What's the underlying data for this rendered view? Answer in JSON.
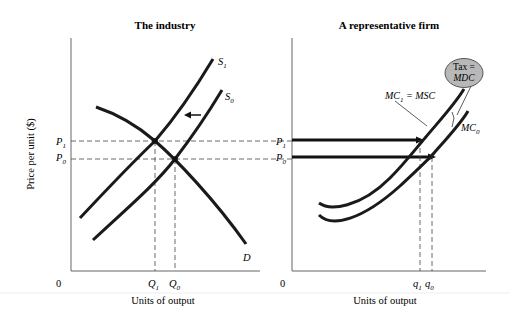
{
  "left_panel": {
    "title": "The industry",
    "y_axis_label": "Price per unit ($)",
    "x_axis_label": "Units of output",
    "origin_label": "0",
    "price_labels": [
      {
        "main": "P",
        "sub": "1"
      },
      {
        "main": "P",
        "sub": "0"
      }
    ],
    "quantity_labels": [
      {
        "main": "Q",
        "sub": "1"
      },
      {
        "main": "Q",
        "sub": "0"
      }
    ],
    "curve_labels": {
      "s1": {
        "main": "S",
        "sub": "1"
      },
      "s0": {
        "main": "S",
        "sub": "0"
      },
      "d": "D"
    },
    "arrow": "shift-left-arrow"
  },
  "right_panel": {
    "title": "A representative firm",
    "x_axis_label": "Units of output",
    "origin_label": "0",
    "price_labels": [
      {
        "main": "P",
        "sub": "1"
      },
      {
        "main": "P",
        "sub": "0"
      }
    ],
    "quantity_labels": [
      {
        "main": "q",
        "sub": "1"
      },
      {
        "main": "q",
        "sub": "0"
      }
    ],
    "curve_labels": {
      "mc1": {
        "main": "MC",
        "sub": "1",
        "suffix": " = MSC"
      },
      "mc0": {
        "main": "MC",
        "sub": "0"
      }
    },
    "callout": {
      "line1": "Tax =",
      "line2": "MDC",
      "fill": "#b8b8b8"
    }
  },
  "colors": {
    "curve": "#1a1a1a",
    "axis": "#555555",
    "dash": "#444444",
    "background": "#ffffff"
  }
}
